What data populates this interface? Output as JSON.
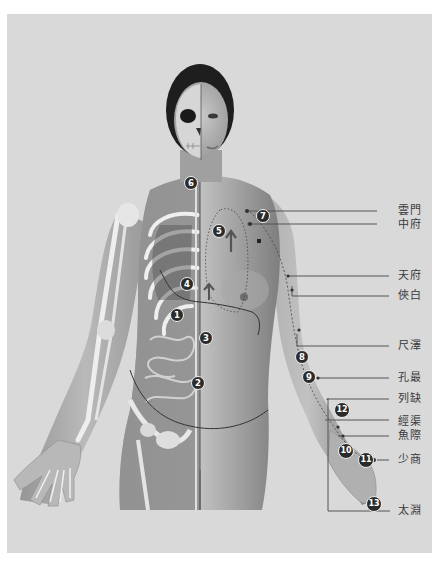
{
  "figure": {
    "colors": {
      "background": "#d9d9d9",
      "line": "#555555",
      "badge": "#2b2b2b",
      "text": "#3a3a3a"
    }
  },
  "markers": [
    {
      "n": "1",
      "x": 176,
      "y": 315
    },
    {
      "n": "2",
      "x": 197,
      "y": 383
    },
    {
      "n": "3",
      "x": 205,
      "y": 338
    },
    {
      "n": "4",
      "x": 186,
      "y": 284
    },
    {
      "n": "5",
      "x": 218,
      "y": 231
    },
    {
      "n": "6",
      "x": 190,
      "y": 183
    },
    {
      "n": "7",
      "x": 262,
      "y": 216
    },
    {
      "n": "8",
      "x": 301,
      "y": 357
    },
    {
      "n": "9",
      "x": 308,
      "y": 377
    },
    {
      "n": "10",
      "x": 345,
      "y": 450
    },
    {
      "n": "11",
      "x": 365,
      "y": 459
    },
    {
      "n": "12",
      "x": 341,
      "y": 409
    },
    {
      "n": "13",
      "x": 373,
      "y": 503
    }
  ],
  "acupoints": [
    {
      "name": "雲門",
      "y": 211
    },
    {
      "name": "中府",
      "y": 224
    },
    {
      "name": "天府",
      "y": 276
    },
    {
      "name": "俠白",
      "y": 296
    },
    {
      "name": "尺澤",
      "y": 346
    },
    {
      "name": "孔最",
      "y": 378
    },
    {
      "name": "列缺",
      "y": 399
    },
    {
      "name": "經渠",
      "y": 422
    },
    {
      "name": "魚際",
      "y": 436
    },
    {
      "name": "少商",
      "y": 460
    },
    {
      "name": "太淵",
      "y": 511
    }
  ]
}
